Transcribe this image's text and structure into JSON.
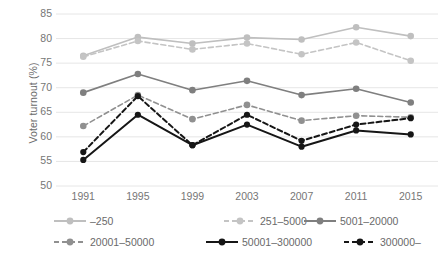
{
  "chart_data": {
    "type": "line",
    "title": "",
    "xlabel": "",
    "ylabel": "Voter turnout (%)",
    "categories": [
      "1991",
      "1995",
      "1999",
      "2003",
      "2007",
      "2011",
      "2015"
    ],
    "x": [
      1991,
      1995,
      1999,
      2003,
      2007,
      2011,
      2015
    ],
    "ylim": [
      50,
      85
    ],
    "yticks": [
      50,
      55,
      60,
      65,
      70,
      75,
      80,
      85
    ],
    "grid": "horizontal",
    "legend_position": "bottom",
    "series": [
      {
        "name": "–250",
        "values": [
          76.5,
          80.3,
          79.0,
          80.2,
          79.8,
          82.3,
          80.5
        ],
        "color": "#bfbfbf",
        "dash": "solid"
      },
      {
        "name": "251–5000",
        "values": [
          76.3,
          79.5,
          77.8,
          79.0,
          76.8,
          79.2,
          75.5
        ],
        "color": "#c4c4c4",
        "dash": "dashed"
      },
      {
        "name": "5001–20000",
        "values": [
          69.0,
          72.8,
          69.5,
          71.4,
          68.5,
          69.8,
          67.0
        ],
        "color": "#7f7f7f",
        "dash": "solid"
      },
      {
        "name": "20001–50000",
        "values": [
          62.2,
          68.5,
          63.6,
          66.5,
          63.3,
          64.3,
          64.0
        ],
        "color": "#909090",
        "dash": "dashed"
      },
      {
        "name": "50001–300000",
        "values": [
          55.3,
          64.5,
          58.3,
          62.5,
          58.0,
          61.3,
          60.5
        ],
        "color": "#161616",
        "dash": "solid"
      },
      {
        "name": "300000–",
        "values": [
          56.9,
          68.3,
          58.3,
          64.5,
          59.2,
          62.5,
          63.8
        ],
        "color": "#161616",
        "dash": "dashed"
      }
    ]
  },
  "axes": {
    "y_title": "Voter turnout (%)",
    "y_ticks": [
      "85",
      "80",
      "75",
      "70",
      "65",
      "60",
      "55",
      "50"
    ],
    "x_ticks": [
      "1991",
      "1995",
      "1999",
      "2003",
      "2007",
      "2011",
      "2015"
    ]
  },
  "legend": {
    "row0": [
      "–250",
      "251–5000",
      "5001–20000"
    ],
    "row1": [
      "20001–50000",
      "50001–300000",
      "300000–"
    ]
  },
  "colors": {
    "gridline": "#e6e6e6",
    "axis_text": "#767676",
    "light_gray": "#bfbfbf",
    "mid_gray": "#7f7f7f",
    "black": "#161616",
    "background": "#ffffff"
  }
}
